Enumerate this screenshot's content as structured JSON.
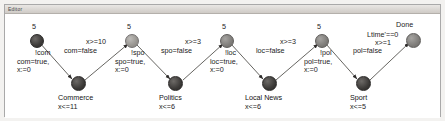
{
  "window": {
    "title": "Editor",
    "titlebar_icon": "window-icon"
  },
  "diagram": {
    "type": "timed-automaton",
    "clock_bounds": [
      "5",
      "5",
      "5",
      "5",
      "5"
    ],
    "final_label": "Done",
    "states": [
      {
        "name": "Commerce",
        "invariant": "x<=11"
      },
      {
        "name": "Politics",
        "invariant": "x<=6"
      },
      {
        "name": "Local News",
        "invariant": "x<=6"
      },
      {
        "name": "Sport",
        "invariant": "x<=5"
      }
    ],
    "down_transitions": [
      {
        "sync": "!com",
        "assign_line1": "com=true,",
        "assign_line2": "x:=0"
      },
      {
        "sync": "!spo",
        "assign_line1": "spo=true,",
        "assign_line2": "x:=0"
      },
      {
        "sync": "!loc",
        "assign_line1": "loc=true,",
        "assign_line2": "x:=0"
      },
      {
        "sync": "!pol",
        "assign_line1": "pol=true,",
        "assign_line2": "x:=0"
      }
    ],
    "up_transitions": [
      {
        "guard": "x>=10",
        "assign": "com=false"
      },
      {
        "guard": "x>=3",
        "assign": "spo=false"
      },
      {
        "guard": "x>=3",
        "assign": "loc=false"
      },
      {
        "guard": "x>=1",
        "assign": "pol=false",
        "extra": "Ltime'==0"
      }
    ]
  },
  "colors": {
    "node_dark": "#3b3937",
    "node_mid": "#7e7c79",
    "node_light": "#97948f",
    "canvas": "#ffffff",
    "chrome": "#cfcbc6",
    "text": "#1b1b1b"
  }
}
